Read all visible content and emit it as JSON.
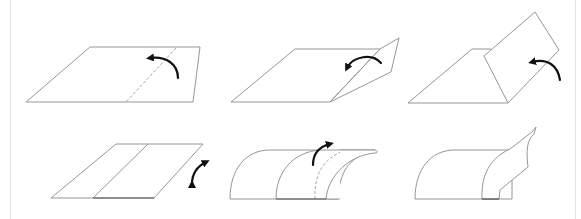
{
  "diagram": {
    "layout": {
      "rows": 2,
      "columns": 3
    },
    "colors": {
      "background": "#ffffff",
      "outline": "#8a8a8a",
      "arrow": "#111111",
      "fold_line": "#9a9a9a"
    },
    "steps": [
      {
        "id": 1,
        "row": 1,
        "col": 1,
        "description": "Flat sheet with dashed fold line near right; curved arrow indicates folding up/over"
      },
      {
        "id": 2,
        "row": 1,
        "col": 2,
        "description": "Right portion lifted along dashed fold line; arrow shows flap folding back"
      },
      {
        "id": 3,
        "row": 1,
        "col": 3,
        "description": "Right portion standing upright as a flap; arrow shows continued fold"
      },
      {
        "id": 4,
        "row": 2,
        "col": 1,
        "description": "Flat sheet with solid crease line; double-headed curved arrow at right edge"
      },
      {
        "id": 5,
        "row": 2,
        "col": 2,
        "description": "Sheet curled into a curved tunnel shape with dashed inner line; arrow indicates rolling over"
      },
      {
        "id": 6,
        "row": 2,
        "col": 3,
        "description": "Curved sheet with free edge flap curling upward at the right"
      }
    ]
  }
}
